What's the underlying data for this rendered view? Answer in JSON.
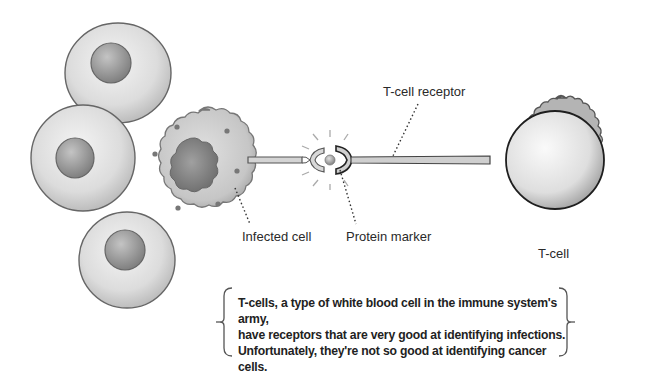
{
  "labels": {
    "tcell_receptor": "T-cell receptor",
    "infected_cell": "Infected cell",
    "protein_marker": "Protein marker",
    "tcell": "T-cell"
  },
  "caption": {
    "lines": [
      "T-cells, a type of white blood cell in the immune system's army,",
      "have receptors that are very good at identifying infections.",
      "Unfortunately, they're not so good at identifying cancer cells."
    ]
  },
  "colors": {
    "cell_fill": "#e6e6e6",
    "cell_outline": "#6a6a6a",
    "nucleus": "#9a9a9a",
    "infected_fill": "#c8c8c8",
    "infected_nucleus": "#7e7e7e",
    "tcell_outer": "#b8b8b8",
    "tcell_inner": "#ececec",
    "ink": "#222222"
  }
}
